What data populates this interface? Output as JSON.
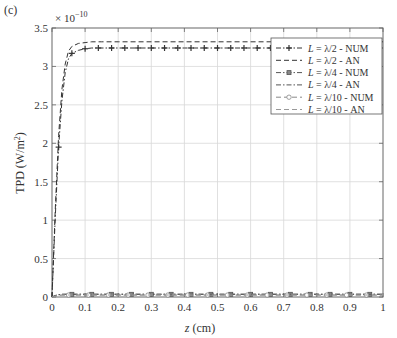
{
  "panel_label": "(c)",
  "chart_data": {
    "type": "line",
    "title": "",
    "panel_label": "(c)",
    "xlabel": "z (cm)",
    "ylabel": "TPD (W/m²)",
    "y_multiplier": "× 10^-10",
    "xlim": [
      0,
      1
    ],
    "ylim": [
      0,
      3.5
    ],
    "xticks": [
      0,
      0.1,
      0.2,
      0.3,
      0.4,
      0.5,
      0.6,
      0.7,
      0.8,
      0.9,
      1
    ],
    "xtick_labels": [
      "0",
      "0.1",
      "0.2",
      "0.3",
      "0.4",
      "0.5",
      "0.6",
      "0.7",
      "0.8",
      "0.9",
      "1"
    ],
    "yticks": [
      0,
      0.5,
      1,
      1.5,
      2,
      2.5,
      3,
      3.5
    ],
    "ytick_labels": [
      "0",
      "0.5",
      "1",
      "1.5",
      "2",
      "2.5",
      "3",
      "3.5"
    ],
    "grid": true,
    "legend_position": "upper right",
    "x": [
      0,
      0.005,
      0.01,
      0.02,
      0.03,
      0.04,
      0.05,
      0.06,
      0.08,
      0.1,
      0.12,
      0.15,
      0.2,
      0.3,
      0.4,
      0.5,
      0.6,
      0.7,
      0.8,
      0.9,
      1.0
    ],
    "series": [
      {
        "name": "L = λ/2 - NUM",
        "label_var": "L",
        "label_rest": " = λ/2 - NUM",
        "style": "dash-dot",
        "marker": "plus",
        "color": "#333333",
        "values": [
          0,
          0.55,
          1.05,
          1.95,
          2.55,
          2.92,
          3.1,
          3.17,
          3.21,
          3.23,
          3.24,
          3.24,
          3.24,
          3.24,
          3.24,
          3.24,
          3.24,
          3.24,
          3.24,
          3.24,
          3.24
        ]
      },
      {
        "name": "L = λ/2 - AN",
        "label_var": "L",
        "label_rest": " = λ/2 - AN",
        "style": "dashed",
        "marker": "none",
        "color": "#333333",
        "values": [
          0,
          0.6,
          1.15,
          2.1,
          2.7,
          3.03,
          3.2,
          3.26,
          3.3,
          3.31,
          3.32,
          3.32,
          3.32,
          3.32,
          3.32,
          3.32,
          3.32,
          3.32,
          3.32,
          3.32,
          3.32
        ]
      },
      {
        "name": "L = λ/4 - NUM",
        "label_var": "L",
        "label_rest": " = λ/4 - NUM",
        "style": "dash-dot",
        "marker": "square",
        "color": "#555555",
        "values": [
          0,
          0.01,
          0.02,
          0.03,
          0.035,
          0.035,
          0.035,
          0.035,
          0.035,
          0.035,
          0.035,
          0.035,
          0.035,
          0.035,
          0.035,
          0.035,
          0.035,
          0.035,
          0.035,
          0.035,
          0.035
        ]
      },
      {
        "name": "L = λ/4 - AN",
        "label_var": "L",
        "label_rest": " = λ/4 - AN",
        "style": "dash-dot",
        "marker": "none",
        "color": "#555555",
        "values": [
          0,
          0.01,
          0.02,
          0.03,
          0.035,
          0.036,
          0.036,
          0.036,
          0.036,
          0.036,
          0.036,
          0.036,
          0.036,
          0.036,
          0.036,
          0.036,
          0.036,
          0.036,
          0.036,
          0.036,
          0.036
        ]
      },
      {
        "name": "L = λ/10 - NUM",
        "label_var": "L",
        "label_rest": " = λ/10 - NUM",
        "style": "dashed",
        "marker": "circle",
        "color": "#888888",
        "values": [
          0,
          0.005,
          0.01,
          0.02,
          0.025,
          0.025,
          0.025,
          0.025,
          0.025,
          0.025,
          0.025,
          0.025,
          0.025,
          0.025,
          0.025,
          0.025,
          0.025,
          0.025,
          0.025,
          0.025,
          0.025
        ]
      },
      {
        "name": "L = λ/10 - AN",
        "label_var": "L",
        "label_rest": " = λ/10 - AN",
        "style": "dashed",
        "marker": "none",
        "color": "#999999",
        "values": [
          0,
          0.005,
          0.01,
          0.02,
          0.026,
          0.026,
          0.026,
          0.026,
          0.026,
          0.026,
          0.026,
          0.026,
          0.026,
          0.026,
          0.026,
          0.026,
          0.026,
          0.026,
          0.026,
          0.026,
          0.026
        ]
      }
    ]
  }
}
